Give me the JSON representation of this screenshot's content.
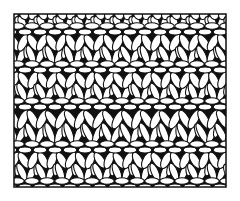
{
  "figure": {
    "width": 240,
    "height": 201,
    "background": "#ffffff",
    "ink": "#111111",
    "frame": {
      "x": 14,
      "y": 14,
      "w": 212,
      "h": 173,
      "stroke_width": 1.5
    },
    "chain_bands_y": [
      29,
      67,
      104,
      147,
      184
    ],
    "gap_bands_y": [
      46,
      86,
      124,
      165
    ],
    "stitch_column_spacing": 19,
    "oval_spacing": 15
  }
}
